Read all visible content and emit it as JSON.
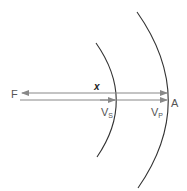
{
  "diagram": {
    "type": "wavefront-epicenter-distance",
    "labels": {
      "focus": "F",
      "distance": "x",
      "s_wave": "V",
      "s_wave_sub": "S",
      "p_wave": "V",
      "p_wave_sub": "P",
      "station": "A"
    },
    "colors": {
      "arc": "#333333",
      "arrow": "#888888",
      "label": "#555555"
    }
  }
}
